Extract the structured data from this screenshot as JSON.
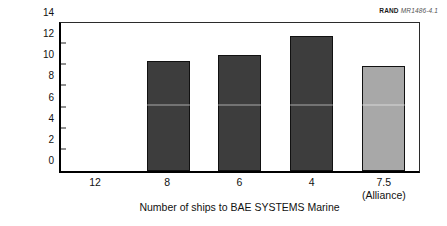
{
  "credit": {
    "publisher": "RAND",
    "document_id": "MR1486-4.1"
  },
  "chart_data": {
    "type": "bar",
    "title": "",
    "xlabel": "Number of ships to BAE SYSTEMS Marine",
    "ylabel": "Cost penalty (%)",
    "categories": [
      "12",
      "8",
      "6",
      "4",
      "7.5"
    ],
    "category_sublabels": [
      "",
      "",
      "",
      "",
      "(Alliance)"
    ],
    "values": [
      0,
      10.4,
      11.0,
      12.8,
      9.9
    ],
    "ylim": [
      0,
      14
    ],
    "yticks": [
      "0",
      "2",
      "4",
      "6",
      "8",
      "10",
      "12",
      "14"
    ],
    "grid": false,
    "legend": false,
    "bar_colors": [
      "#3d3d3d",
      "#3d3d3d",
      "#3d3d3d",
      "#3d3d3d",
      "#a8a8a8"
    ],
    "colors": {
      "bar_dark": "#3d3d3d",
      "bar_light": "#a8a8a8",
      "axis": "#000000",
      "frame": "#2b2b2b",
      "background": "#ffffff"
    }
  }
}
